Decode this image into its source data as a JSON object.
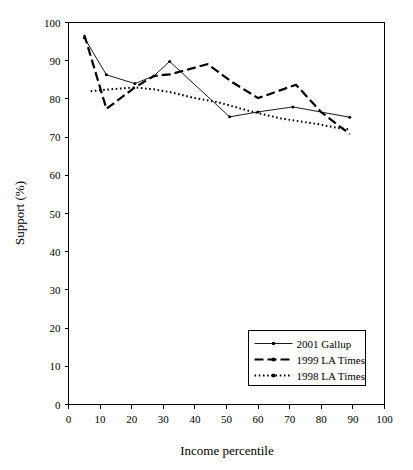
{
  "chart_data": {
    "type": "line",
    "title": "",
    "xlabel": "Income percentile",
    "ylabel": "Support (%)",
    "xlim": [
      0,
      100
    ],
    "ylim": [
      0,
      100
    ],
    "xticks": [
      0,
      10,
      20,
      30,
      40,
      50,
      60,
      70,
      80,
      90,
      100
    ],
    "yticks": [
      0,
      10,
      20,
      30,
      40,
      50,
      60,
      70,
      80,
      90,
      100
    ],
    "grid": false,
    "legend_position": "lower right",
    "series": [
      {
        "name": "2001 Gallup",
        "style": "solid-thin-dot-marker",
        "x": [
          5,
          12,
          21,
          27,
          32,
          51,
          60,
          71,
          89
        ],
        "y": [
          96.0,
          86.3,
          84.0,
          86.0,
          89.8,
          75.3,
          76.6,
          77.9,
          75.2
        ]
      },
      {
        "name": "1999 LA Times",
        "style": "dashed-thick",
        "x": [
          5,
          12,
          21,
          27,
          32,
          44,
          52,
          60,
          72,
          80,
          89
        ],
        "y": [
          96.8,
          77.4,
          83.0,
          86.0,
          86.4,
          89.1,
          84.3,
          80.2,
          83.7,
          76.5,
          70.8
        ]
      },
      {
        "name": "1998 LA Times",
        "style": "dotted",
        "x": [
          7,
          13,
          21,
          27,
          32,
          40,
          47,
          57,
          67,
          79,
          85,
          89
        ],
        "y": [
          82.0,
          82.5,
          83.0,
          82.5,
          81.8,
          80.2,
          79.2,
          76.9,
          74.9,
          73.4,
          72.4,
          72.0
        ]
      }
    ]
  },
  "legend": {
    "items": [
      {
        "label": "2001 Gallup"
      },
      {
        "label": "1999 LA Times"
      },
      {
        "label": "1998 LA Times"
      }
    ]
  },
  "axes": {
    "x_title": "Income percentile",
    "y_title": "Support (%)"
  }
}
